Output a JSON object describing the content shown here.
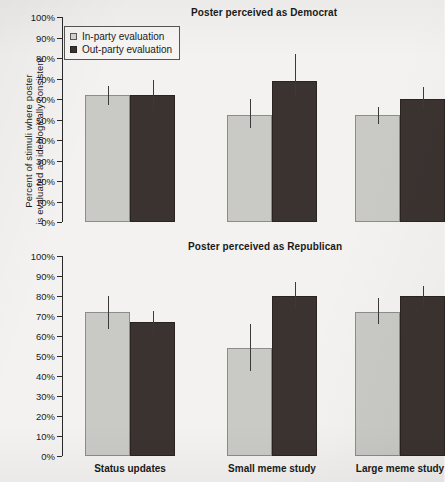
{
  "figure": {
    "ylabel_line1": "Percent of stimuli where poster",
    "ylabel_line2": "is evaluated as ideologically consistent",
    "legend": {
      "in_party_label": "In-party evaluation",
      "out_party_label": "Out-party evaluation",
      "in_party_color": "#d5d5d2",
      "out_party_color": "#3b3330"
    }
  },
  "chart_data": [
    {
      "type": "bar",
      "title": "Poster perceived as Democrat",
      "xlabel": "",
      "ylabel": "Percent of stimuli where poster is evaluated as ideologically consistent",
      "categories": [
        "Status updates",
        "Small meme study",
        "Large meme study"
      ],
      "ylim": [
        0,
        100
      ],
      "ytick_labels": [
        "0%",
        "10%",
        "20%",
        "30%",
        "40%",
        "50%",
        "60%",
        "70%",
        "80%",
        "90%",
        "100%"
      ],
      "ytick_values": [
        0,
        10,
        20,
        30,
        40,
        50,
        60,
        70,
        80,
        90,
        100
      ],
      "grid": false,
      "legend_position": "upper-left",
      "series": [
        {
          "name": "In-party evaluation",
          "color": "#c9c9c6",
          "values": [
            62,
            52,
            52
          ],
          "error_low": [
            57,
            46,
            48
          ],
          "error_high": [
            66.5,
            60,
            56
          ]
        },
        {
          "name": "Out-party evaluation",
          "color": "#3b3330",
          "values": [
            62,
            69,
            60
          ],
          "error_low": [
            54.5,
            61,
            55
          ],
          "error_high": [
            69.5,
            82,
            66
          ]
        }
      ]
    },
    {
      "type": "bar",
      "title": "Poster perceived as Republican",
      "xlabel": "",
      "ylabel": "Percent of stimuli where poster is evaluated as ideologically consistent",
      "categories": [
        "Status updates",
        "Small meme study",
        "Large meme study"
      ],
      "ylim": [
        0,
        100
      ],
      "ytick_labels": [
        "0%",
        "10%",
        "20%",
        "30%",
        "40%",
        "50%",
        "60%",
        "70%",
        "80%",
        "90%",
        "100%"
      ],
      "ytick_values": [
        0,
        10,
        20,
        30,
        40,
        50,
        60,
        70,
        80,
        90,
        100
      ],
      "grid": false,
      "legend_position": "none",
      "series": [
        {
          "name": "In-party evaluation",
          "color": "#c9c9c6",
          "values": [
            72,
            54,
            72
          ],
          "error_low": [
            63.5,
            42.5,
            66
          ],
          "error_high": [
            80,
            66,
            79
          ]
        },
        {
          "name": "Out-party evaluation",
          "color": "#3b3330",
          "values": [
            67,
            80,
            80
          ],
          "error_low": [
            61,
            74,
            75
          ],
          "error_high": [
            72.5,
            87,
            85
          ]
        }
      ]
    }
  ]
}
